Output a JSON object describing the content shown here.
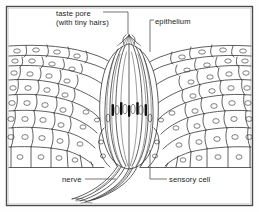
{
  "figure": {
    "type": "labelled-biological-diagram",
    "frame": {
      "border_color": "#4a4a4a",
      "background": "#ffffff"
    },
    "ink_color": "#2b2b2b",
    "nucleus_color": "#111111",
    "labels": [
      {
        "id": "taste-pore",
        "line1": "taste pore",
        "line2": "(with tiny hairs)"
      },
      {
        "id": "epithelium",
        "text": "epithelium"
      },
      {
        "id": "nerve",
        "text": "nerve"
      },
      {
        "id": "sensory-cell",
        "text": "sensory cell"
      }
    ],
    "structures": [
      "stratified squamous epithelium",
      "taste pore with gustatory hairs",
      "taste bud (barrel shaped)",
      "sensory cells with dark nuclei",
      "basement membrane",
      "nerve fibre bundle"
    ]
  }
}
